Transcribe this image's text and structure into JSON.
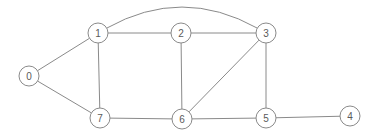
{
  "diagram": {
    "type": "node-link-graph",
    "width": 373,
    "height": 137,
    "background_color": "#ffffff",
    "edge_color": "#8a8a8a",
    "node_fill_color": "#ffffff",
    "node_stroke_color": "#8a8a8a",
    "node_label_color": "#5a5a5a",
    "node_radius": 10,
    "edge_width": 1,
    "nodes": [
      {
        "id": "0",
        "label": "0",
        "x": 29,
        "y": 76
      },
      {
        "id": "1",
        "label": "1",
        "x": 98,
        "y": 33
      },
      {
        "id": "2",
        "label": "2",
        "x": 181,
        "y": 33
      },
      {
        "id": "3",
        "label": "3",
        "x": 266,
        "y": 33
      },
      {
        "id": "4",
        "label": "4",
        "x": 350,
        "y": 116
      },
      {
        "id": "5",
        "label": "5",
        "x": 266,
        "y": 118
      },
      {
        "id": "6",
        "label": "6",
        "x": 182,
        "y": 119
      },
      {
        "id": "7",
        "label": "7",
        "x": 100,
        "y": 118
      }
    ],
    "edges": [
      {
        "source": "0",
        "target": "1",
        "shape": "straight"
      },
      {
        "source": "0",
        "target": "7",
        "shape": "straight"
      },
      {
        "source": "1",
        "target": "2",
        "shape": "straight"
      },
      {
        "source": "1",
        "target": "7",
        "shape": "straight"
      },
      {
        "source": "1",
        "target": "3",
        "shape": "curved",
        "control_x": 182,
        "control_y": -14
      },
      {
        "source": "2",
        "target": "3",
        "shape": "straight"
      },
      {
        "source": "2",
        "target": "6",
        "shape": "straight"
      },
      {
        "source": "3",
        "target": "5",
        "shape": "straight"
      },
      {
        "source": "3",
        "target": "6",
        "shape": "straight"
      },
      {
        "source": "5",
        "target": "4",
        "shape": "straight"
      },
      {
        "source": "5",
        "target": "6",
        "shape": "straight"
      },
      {
        "source": "6",
        "target": "7",
        "shape": "straight"
      }
    ]
  }
}
